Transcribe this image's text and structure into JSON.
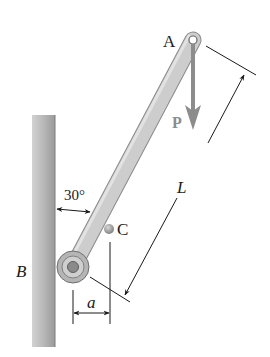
{
  "diagram": {
    "type": "statics-mechanism",
    "labels": {
      "pin_a": "A",
      "force": "P",
      "length": "L",
      "mass_center": "C",
      "angle": "30°",
      "support": "B",
      "offset": "a"
    },
    "colors": {
      "wall": "#a9a9a9",
      "rod": "#c9c9c9",
      "rod_edge": "#8a8a8a",
      "force_arrow": "#8c8c8c",
      "dimension_line": "#1a1a1a",
      "text": "#1a1a1a"
    },
    "angle_deg": 30
  }
}
